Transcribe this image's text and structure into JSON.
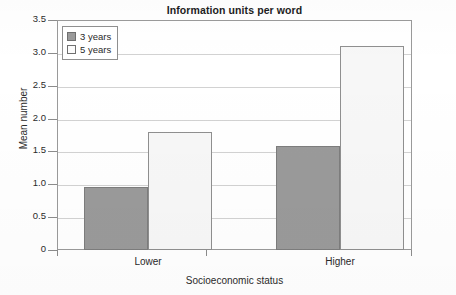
{
  "chart_data": {
    "type": "bar",
    "title": "Information units per word",
    "xlabel": "Socioeconomic status",
    "ylabel": "Mean number",
    "categories": [
      "Lower",
      "Higher"
    ],
    "series": [
      {
        "name": "3 years",
        "values": [
          0.96,
          1.58
        ],
        "color": "#9a9a9a"
      },
      {
        "name": "5 years",
        "values": [
          1.79,
          3.11
        ],
        "color": "#f7f7f7"
      }
    ],
    "ylim": [
      0,
      3.5
    ],
    "ytick_values": [
      0,
      0.5,
      1.0,
      1.5,
      2.0,
      2.5,
      3.0,
      3.5
    ],
    "ytick_labels": [
      "0",
      "0.5",
      "1.0",
      "1.5",
      "2.0",
      "2.5",
      "3.0",
      "3.5"
    ],
    "grid": "horizontal",
    "legend_position": "top-left"
  },
  "legend": {
    "items": [
      {
        "label": "3 years",
        "swatch": "dark-gray-swatch"
      },
      {
        "label": "5 years",
        "swatch": "light-swatch"
      }
    ]
  }
}
